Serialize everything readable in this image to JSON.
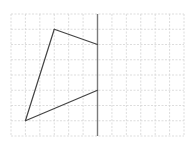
{
  "diagram": {
    "type": "grid-reflection",
    "grid": {
      "columns": 12,
      "rows": 8
    },
    "axis": {
      "orientation": "vertical",
      "column": 6
    },
    "shape": {
      "name": "quadrilateral",
      "vertices": [
        {
          "col": 3,
          "row": 1
        },
        {
          "col": 6,
          "row": 2
        },
        {
          "col": 6,
          "row": 5
        },
        {
          "col": 1,
          "row": 7
        }
      ],
      "closed_side_on_axis": true
    },
    "colors": {
      "grid": "#d4d4d4",
      "axis": "#7a7a7a",
      "shape": "#444444",
      "background": "#ffffff"
    }
  }
}
